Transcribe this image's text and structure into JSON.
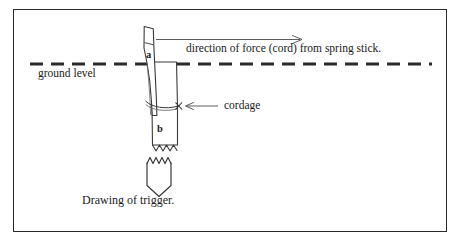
{
  "figure": {
    "caption": "Drawing of trigger.",
    "border_color": "#2b2b2b",
    "ink_color": "#2b2b2b",
    "background_color": "#ffffff"
  },
  "labels": {
    "ground_level": "ground level",
    "force_direction": "direction of force (cord) from spring stick.",
    "cordage": "cordage",
    "part_a": "a",
    "part_b": "b"
  },
  "diagram": {
    "type": "line-drawing",
    "ground_line": {
      "style": "dashed",
      "y": 64,
      "x_start": 30,
      "x_end": 432,
      "dash_length": 13,
      "dash_gap": 8,
      "thickness": 3
    },
    "force_arrow": {
      "y": 39,
      "x_start": 156,
      "x_end": 302,
      "direction": "right",
      "head": "open"
    },
    "cordage_pointer": {
      "y": 106,
      "x_start": 218,
      "x_end": 182,
      "direction": "left",
      "marker": "x-cross",
      "marker_x": 179
    },
    "parts": [
      {
        "id": "a",
        "name": "trigger-stick",
        "description": "narrow tapered stick, notched, leaning slightly, crosses ground level"
      },
      {
        "id": "b",
        "name": "ground-post",
        "description": "wider vertical post set in ground, broken off at base with jagged line"
      },
      {
        "id": "trigger-detail",
        "name": "detached-trigger-piece",
        "description": "separate pointed piece with jagged top edge shown below the main drawing"
      }
    ]
  }
}
